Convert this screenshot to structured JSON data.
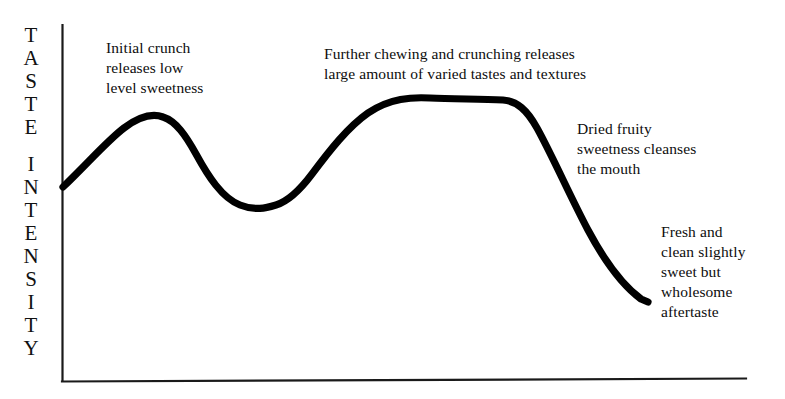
{
  "figure": {
    "background_color": "#ffffff",
    "ink_color": "#000000",
    "width": 785,
    "height": 399
  },
  "axes": {
    "y_axis_title_words": [
      "TASTE",
      "INTENSITY"
    ],
    "y_axis_title_full": "TASTE INTENSITY",
    "x_axis_title": "",
    "x_axis_tick_labels": [],
    "y_axis_tick_labels": []
  },
  "annotations": [
    {
      "id": "initial",
      "text": "Initial crunch\nreleases low\nlevel sweetness"
    },
    {
      "id": "further",
      "text": "Further chewing and crunching releases\nlarge amount of varied tastes and textures"
    },
    {
      "id": "dried",
      "text": "Dried fruity\nsweetness cleanses\nthe mouth"
    },
    {
      "id": "fresh",
      "text": "Fresh and\nclean slightly\nsweet but\nwholesome\naftertaste"
    }
  ],
  "chart_data": {
    "type": "line",
    "title": "",
    "subtitle": "",
    "xlabel": "",
    "ylabel": "TASTE INTENSITY",
    "xlim": [
      0,
      100
    ],
    "ylim": [
      0,
      100
    ],
    "grid": false,
    "legend": null,
    "axis_style": {
      "show_x_axis": true,
      "show_y_axis": true,
      "show_ticks": false,
      "line_width_px": 2
    },
    "series": [
      {
        "name": "Taste intensity over time",
        "line_width_px": 7,
        "color": "#000000",
        "x": [
          0,
          6,
          14,
          22,
          31,
          40,
          48,
          55,
          63,
          70,
          77,
          84,
          90,
          94,
          98
        ],
        "y": [
          54,
          62,
          71,
          75,
          73,
          64,
          52,
          49,
          52,
          63,
          76,
          85,
          87,
          87,
          83
        ],
        "annotated_points": [
          {
            "label": "start",
            "x": 0,
            "y": 54
          },
          {
            "label": "first peak - initial crunch",
            "x": 14,
            "y": 75
          },
          {
            "label": "valley",
            "x": 31,
            "y": 49
          },
          {
            "label": "plateau start",
            "x": 54,
            "y": 87
          },
          {
            "label": "plateau end",
            "x": 66,
            "y": 87
          },
          {
            "label": "end - aftertaste",
            "x": 86,
            "y": 24
          }
        ]
      }
    ]
  }
}
